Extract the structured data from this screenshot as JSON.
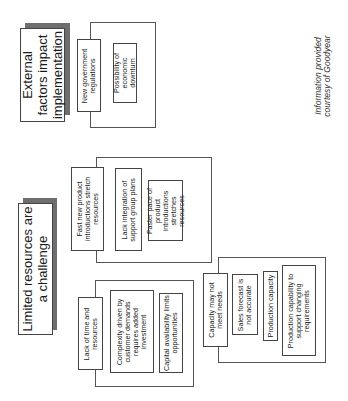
{
  "groups": [
    {
      "title": "External factors impact implementation",
      "items": [
        "New government regulations",
        "Possibility of economic downturn"
      ]
    },
    {
      "title": "Limited resources are a challenge",
      "subgroups": [
        {
          "items": [
            "Fast new product introductions stretch resources",
            "Lack integration of support group plans",
            "Faster pace of product introductions stretches resources"
          ]
        },
        {
          "items": [
            "Lack of time and resources",
            "Complexity driven by customer demands requires added investment",
            "Capital availability limits opportunities"
          ]
        },
        {
          "items": [
            "Capacity may not meet needs",
            "Sales forecast is not accurate",
            "Production capacity",
            "Production capability to support changing requirements"
          ]
        }
      ]
    }
  ],
  "credit": "Information provided courtesy of Goodyear"
}
